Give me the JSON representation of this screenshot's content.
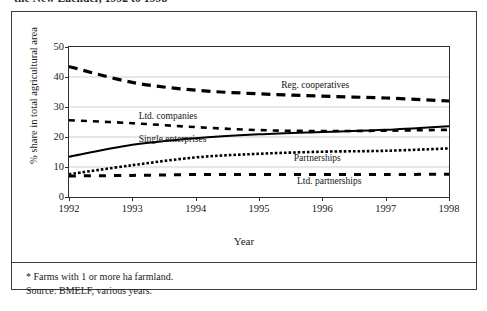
{
  "caption_clipped": "the New Laender, 1992 to 1998",
  "footnotes": {
    "note": "* Farms with 1 or more ha farmland.",
    "source": "Source: BMELF, various years."
  },
  "chart_data": {
    "type": "line",
    "title": "",
    "xlabel": "Year",
    "ylabel": "% share in total agricultural area",
    "categories": [
      1992,
      1993,
      1994,
      1995,
      1996,
      1997,
      1998
    ],
    "xticklabels": [
      "1992",
      "1993",
      "1994",
      "1995",
      "1996",
      "1997",
      "1998"
    ],
    "yticklabels": [
      "0",
      "10",
      "20",
      "30",
      "40",
      "50"
    ],
    "yticks": [
      0,
      10,
      20,
      30,
      40,
      50
    ],
    "ylim": [
      0,
      50
    ],
    "xlim": [
      1992,
      1998
    ],
    "grid": true,
    "legend": "inline-annotations",
    "series": [
      {
        "name": "Reg. cooperatives",
        "style": "long-dashed",
        "label_x": 1995.35,
        "label_y": 37.2,
        "values": [
          43.5,
          38.2,
          35.6,
          34.4,
          33.6,
          33.0,
          32.0
        ]
      },
      {
        "name": "Ltd. companies",
        "style": "short-dashed",
        "label_x": 1993.1,
        "label_y": 27.0,
        "values": [
          25.6,
          24.6,
          23.3,
          22.3,
          22.0,
          22.1,
          22.4
        ]
      },
      {
        "name": "Single enterprises",
        "style": "solid",
        "label_x": 1993.1,
        "label_y": 19.3,
        "values": [
          13.4,
          17.4,
          19.6,
          20.9,
          21.7,
          22.4,
          23.6
        ]
      },
      {
        "name": "Partnerships",
        "style": "dotted",
        "label_x": 1995.55,
        "label_y": 13.1,
        "values": [
          7.6,
          10.6,
          13.2,
          14.4,
          15.1,
          15.4,
          16.2
        ]
      },
      {
        "name": "Ltd. partnerships",
        "style": "medium-dashed",
        "label_x": 1995.6,
        "label_y": 5.2,
        "values": [
          7.0,
          7.2,
          7.5,
          7.5,
          7.5,
          7.5,
          7.6
        ]
      }
    ]
  }
}
